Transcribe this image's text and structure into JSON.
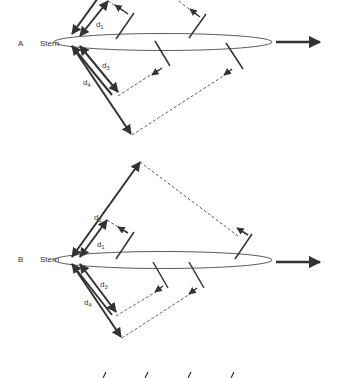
{
  "diagram": {
    "panels": [
      {
        "id": "A",
        "label": "A",
        "stern_label": "Stern",
        "distances": [
          {
            "name": "d",
            "sub": "1"
          },
          {
            "name": "d",
            "sub": "3"
          },
          {
            "name": "d",
            "sub": "4"
          }
        ]
      },
      {
        "id": "B",
        "label": "B",
        "stern_label": "Stern",
        "distances": [
          {
            "name": "d",
            "sub": "2"
          },
          {
            "name": "d",
            "sub": "1"
          },
          {
            "name": "d",
            "sub": "3"
          },
          {
            "name": "d",
            "sub": "4"
          }
        ]
      }
    ],
    "colors": {
      "stroke": "#333333",
      "background": "#ffffff"
    }
  }
}
